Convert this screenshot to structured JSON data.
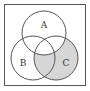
{
  "diagram": {
    "type": "venn",
    "sets": [
      {
        "label": "A"
      },
      {
        "label": "B"
      },
      {
        "label": "C"
      }
    ],
    "shaded_region": "C minus A",
    "colors": {
      "shade": "#d6d6d6",
      "stroke": "#555555",
      "background": "#ffffff"
    }
  }
}
